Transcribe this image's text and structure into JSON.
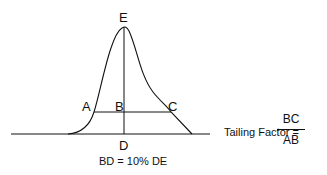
{
  "diagram": {
    "points": {
      "A": "A",
      "B": "B",
      "C": "C",
      "D": "D",
      "E": "E"
    },
    "caption": "BD = 10% DE",
    "formula": {
      "label": "Tailing Factor =",
      "numerator": "BC",
      "denominator": "AB"
    },
    "colors": {
      "line": "#111111",
      "background": "#ffffff"
    }
  }
}
